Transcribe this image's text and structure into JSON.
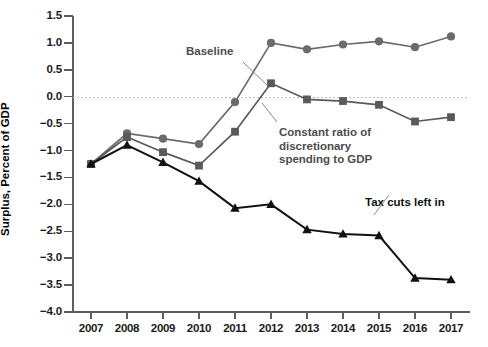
{
  "chart_data": {
    "type": "line",
    "title": "",
    "xlabel": "",
    "ylabel": "Surplus, Percent of GDP",
    "categories": [
      "2007",
      "2008",
      "2009",
      "2010",
      "2011",
      "2012",
      "2013",
      "2014",
      "2015",
      "2016",
      "2017"
    ],
    "x": [
      2007,
      2008,
      2009,
      2010,
      2011,
      2012,
      2013,
      2014,
      2015,
      2016,
      2017
    ],
    "xlim": [
      2006.5,
      2017.5
    ],
    "ylim": [
      -4.0,
      1.5
    ],
    "yticks": [
      1.5,
      1.0,
      0.5,
      0.0,
      -0.5,
      -1.0,
      -1.5,
      -2.0,
      -2.5,
      -3.0,
      -3.5,
      -4.0
    ],
    "ytick_labels": [
      "1.5",
      "1.0",
      "0.5",
      "0.0",
      "−0.5",
      "−1.0",
      "−1.5",
      "−2.0",
      "−2.5",
      "−3.0",
      "−3.5",
      "−4.0"
    ],
    "grid": false,
    "zero_reference_line": true,
    "legend": "none",
    "series": [
      {
        "name": "Baseline",
        "color": "#6b6b6b",
        "marker": "circle",
        "values": [
          -1.25,
          -0.68,
          -0.78,
          -0.88,
          -0.1,
          1.0,
          0.88,
          0.97,
          1.03,
          0.92,
          1.12
        ]
      },
      {
        "name": "Constant ratio of discretionary spending to GDP",
        "color": "#5a5a5a",
        "marker": "square",
        "values": [
          -1.25,
          -0.75,
          -1.03,
          -1.28,
          -0.65,
          0.25,
          -0.05,
          -0.08,
          -0.15,
          -0.46,
          -0.38
        ]
      },
      {
        "name": "Tax cuts left in",
        "color": "#111111",
        "marker": "triangle",
        "values": [
          -1.25,
          -0.9,
          -1.22,
          -1.57,
          -2.07,
          -2.0,
          -2.47,
          -2.55,
          -2.58,
          -3.37,
          -3.4
        ]
      }
    ],
    "annotations": [
      {
        "text": "Baseline",
        "x": 186,
        "y": 45,
        "color": "#4c4c4c",
        "leader": {
          "x1": 243,
          "y1": 62,
          "x2": 268,
          "y2": 86
        }
      },
      {
        "text": "Constant ratio of\ndiscretionary\nspending to GDP",
        "x": 279,
        "y": 126,
        "color": "#4c4c4c",
        "leader": {
          "x1": 277,
          "y1": 122,
          "x2": 262,
          "y2": 103
        }
      },
      {
        "text": "Tax cuts left in",
        "x": 365,
        "y": 196,
        "color": "#111111",
        "leader": {
          "x1": 374,
          "y1": 215,
          "x2": 389,
          "y2": 195
        }
      }
    ]
  }
}
